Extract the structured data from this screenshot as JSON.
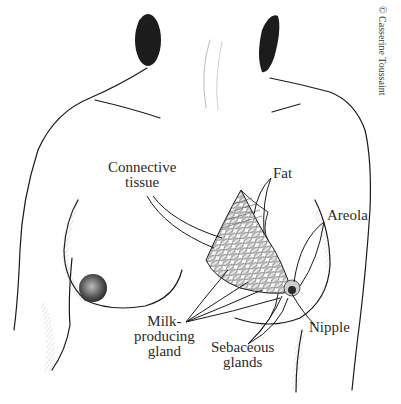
{
  "figure": {
    "type": "anatomical-illustration",
    "copyright": "© Casserine Toussaint"
  },
  "labels": {
    "connective_tissue": {
      "line1": "Connective",
      "line2": "tissue"
    },
    "fat": {
      "line1": "Fat"
    },
    "areola": {
      "line1": "Areola"
    },
    "nipple": {
      "line1": "Nipple"
    },
    "milk_producing_gland": {
      "line1": "Milk-",
      "line2": "producing",
      "line3": "gland"
    },
    "sebaceous_glands": {
      "line1": "Sebaceous",
      "line2": "glands"
    }
  },
  "colors": {
    "ink": "#1a1a1a",
    "label_text": "#2a2a2a",
    "background": "#ffffff",
    "shading": "#9a9a9a"
  }
}
